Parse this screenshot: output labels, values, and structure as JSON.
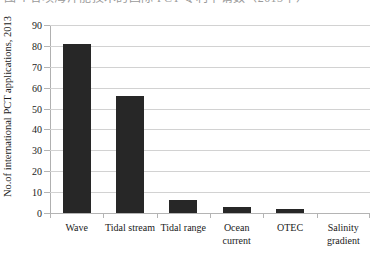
{
  "top_caption": {
    "text": "图 4 各项海洋能技术的国际 PCT 专利申请数（2013年）"
  },
  "chart_data": {
    "type": "bar",
    "title": "",
    "subtitle": "",
    "xlabel": "",
    "ylabel": "No.of international PCT applications, 2013",
    "categories": [
      "Wave",
      "Tidal stream",
      "Tidal range",
      "Ocean current",
      "OTEC",
      "Salinity gradient"
    ],
    "values": [
      81,
      56,
      6,
      3,
      2,
      0
    ],
    "ylim": [
      0,
      90
    ],
    "ytick_labels": [
      "0",
      "10",
      "20",
      "30",
      "40",
      "50",
      "60",
      "70",
      "80",
      "90"
    ],
    "ytick_values": [
      0,
      10,
      20,
      30,
      40,
      50,
      60,
      70,
      80,
      90
    ],
    "grid": true,
    "legend": false,
    "legend_position": "none",
    "bar_color": "#272727",
    "grid_color": "#d2d2d2",
    "axis_color": "#b0b0b0",
    "background": "#ffffff"
  }
}
